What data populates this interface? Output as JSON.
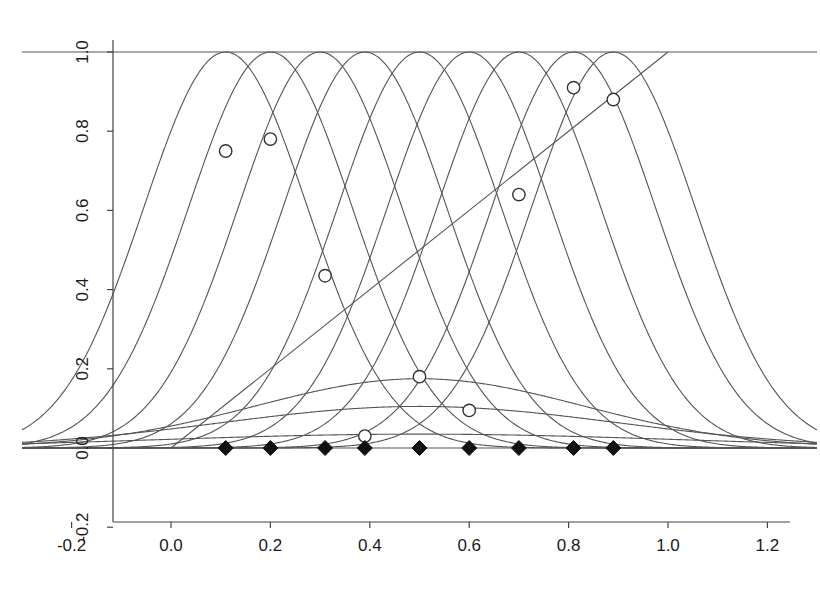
{
  "figure": {
    "background_color": "#ffffff",
    "line_color": "#555555",
    "axis_color": "#444444",
    "marker_edge_color": "#333333",
    "marker_fill_color": "#111111"
  },
  "axes": {
    "x_ticks": [
      "-0.2",
      "0.0",
      "0.2",
      "0.4",
      "0.6",
      "0.8",
      "1.0",
      "1.2"
    ],
    "y_ticks": [
      "-0.2",
      "0.0",
      "0.2",
      "0.4",
      "0.6",
      "0.8",
      "1.0"
    ],
    "x_label": "",
    "y_label": "",
    "title": ""
  },
  "chart_data": {
    "type": "line",
    "title": "",
    "xlabel": "",
    "ylabel": "",
    "xlim": [
      -0.3,
      1.3
    ],
    "ylim": [
      -0.28,
      1.08
    ],
    "grid": false,
    "legend": "none",
    "x_ticks": [
      -0.2,
      0.0,
      0.2,
      0.4,
      0.6,
      0.8,
      1.0,
      1.2
    ],
    "y_ticks": [
      -0.2,
      0.0,
      0.2,
      0.4,
      0.6,
      0.8,
      1.0
    ],
    "series": [
      {
        "name": "basis-1",
        "kind": "basis-curve",
        "center": 0.11,
        "peak": 1.0,
        "width": 0.165
      },
      {
        "name": "basis-2",
        "kind": "basis-curve",
        "center": 0.2,
        "peak": 1.0,
        "width": 0.165
      },
      {
        "name": "basis-3",
        "kind": "basis-curve",
        "center": 0.3,
        "peak": 1.0,
        "width": 0.165
      },
      {
        "name": "basis-4",
        "kind": "basis-curve",
        "center": 0.39,
        "peak": 1.0,
        "width": 0.165
      },
      {
        "name": "basis-5",
        "kind": "basis-curve",
        "center": 0.5,
        "peak": 1.0,
        "width": 0.165
      },
      {
        "name": "basis-6",
        "kind": "basis-curve",
        "center": 0.6,
        "peak": 1.0,
        "width": 0.165
      },
      {
        "name": "basis-7",
        "kind": "basis-curve",
        "center": 0.7,
        "peak": 1.0,
        "width": 0.165
      },
      {
        "name": "basis-8",
        "kind": "basis-curve",
        "center": 0.81,
        "peak": 1.0,
        "width": 0.165
      },
      {
        "name": "basis-9",
        "kind": "basis-curve",
        "center": 0.89,
        "peak": 1.0,
        "width": 0.165
      },
      {
        "name": "low-curve-1",
        "kind": "basis-curve",
        "center": 0.5,
        "peak": 0.175,
        "width": 0.33
      },
      {
        "name": "low-curve-2",
        "kind": "basis-curve",
        "center": 0.5,
        "peak": 0.105,
        "width": 0.4
      },
      {
        "name": "low-curve-3",
        "kind": "basis-curve",
        "center": 0.5,
        "peak": 0.035,
        "width": 0.52
      },
      {
        "name": "top-envelope",
        "kind": "horizontal-line",
        "y": 1.0,
        "x_from": -0.3,
        "x_to": 1.3
      },
      {
        "name": "identity-line",
        "kind": "straight-line",
        "points": [
          [
            0.0,
            0.0
          ],
          [
            1.0,
            1.0
          ]
        ]
      },
      {
        "name": "baseline",
        "kind": "horizontal-line",
        "y": 0.0,
        "x_from": -0.3,
        "x_to": 1.3
      },
      {
        "name": "fitted-points",
        "kind": "scatter",
        "marker": "open-circle",
        "x": [
          0.11,
          0.2,
          0.31,
          0.39,
          0.5,
          0.6,
          0.7,
          0.81,
          0.89
        ],
        "y": [
          0.75,
          0.78,
          0.435,
          0.03,
          0.18,
          0.095,
          0.64,
          0.91,
          0.88
        ]
      },
      {
        "name": "knot-points",
        "kind": "scatter",
        "marker": "filled-diamond",
        "x": [
          0.11,
          0.2,
          0.31,
          0.39,
          0.5,
          0.6,
          0.7,
          0.81,
          0.89
        ],
        "y": [
          0.0,
          0.0,
          0.0,
          0.0,
          0.0,
          0.0,
          0.0,
          0.0,
          0.0
        ]
      }
    ]
  }
}
